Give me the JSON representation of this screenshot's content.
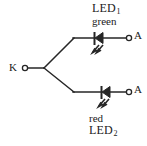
{
  "diagram": {
    "type": "circuit-schematic",
    "stroke_color": "#262626",
    "background_color": "#ffffff",
    "labels": {
      "cathode_terminal": "K",
      "anode_terminal_top": "A",
      "anode_terminal_bottom": "A",
      "led1_name": "LED",
      "led1_subscript": "1",
      "led1_color": "green",
      "led2_name": "LED",
      "led2_subscript": "2",
      "led2_color": "red"
    },
    "components": [
      {
        "id": "led1",
        "label": "LED1",
        "color_text": "green",
        "branch": "top",
        "orientation": "cathode-left"
      },
      {
        "id": "led2",
        "label": "LED2",
        "color_text": "red",
        "branch": "bottom",
        "orientation": "cathode-left"
      }
    ],
    "terminals": [
      {
        "id": "k",
        "label": "K",
        "style": "open-circle",
        "x": 24,
        "y": 68
      },
      {
        "id": "a-top",
        "label": "A",
        "style": "open-circle",
        "x": 129,
        "y": 38
      },
      {
        "id": "a-bottom",
        "label": "A",
        "style": "open-circle",
        "x": 129,
        "y": 92
      }
    ]
  }
}
